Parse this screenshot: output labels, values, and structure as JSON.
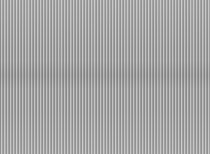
{
  "image": {
    "description": "vertical stripe moire pattern",
    "colors": {
      "dark_stripe": "#8a8a8a",
      "light_stripe": "#c4c4c4",
      "mid_stripe": "#9c9c9c",
      "base": "#a0a0a0"
    }
  }
}
